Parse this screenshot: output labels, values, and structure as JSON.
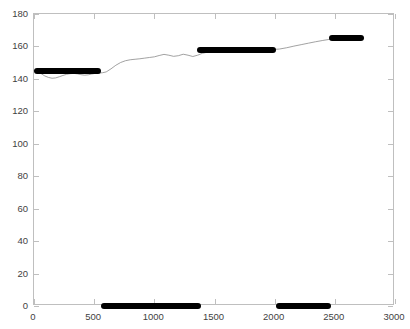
{
  "chart_data": {
    "type": "line",
    "title": "",
    "xlabel": "",
    "ylabel": "",
    "xlim": [
      0,
      3000
    ],
    "ylim": [
      0,
      180
    ],
    "xticks": [
      0,
      500,
      1000,
      1500,
      2000,
      2500,
      3000
    ],
    "yticks": [
      0,
      20,
      40,
      60,
      80,
      100,
      120,
      140,
      160,
      180
    ],
    "xtick_labels": [
      "0",
      "500",
      "1000",
      "1500",
      "2000",
      "2500",
      "3000"
    ],
    "ytick_labels": [
      "0",
      "20",
      "40",
      "60",
      "80",
      "100",
      "120",
      "140",
      "160",
      "180"
    ],
    "grid": false,
    "legend": null,
    "series": [
      {
        "name": "signal-trace",
        "style": "thin-line",
        "color": "#8a8a8a",
        "linewidth": 0.8,
        "x": [
          0,
          30,
          60,
          90,
          120,
          150,
          180,
          210,
          240,
          270,
          300,
          330,
          360,
          390,
          420,
          450,
          480,
          510,
          540,
          570,
          600,
          640,
          680,
          720,
          760,
          800,
          840,
          880,
          920,
          960,
          1000,
          1040,
          1080,
          1120,
          1160,
          1200,
          1240,
          1280,
          1320,
          1360,
          1400,
          1450,
          1500,
          1560,
          1620,
          1680,
          1740,
          1800,
          1860,
          1920,
          1980,
          2040,
          2100,
          2160,
          2220,
          2280,
          2340,
          2400,
          2450,
          2500,
          2560,
          2620,
          2680,
          2740
        ],
        "y": [
          145,
          144.5,
          143.2,
          141.8,
          140.9,
          140.4,
          140.6,
          141.3,
          142.1,
          142.8,
          143.2,
          143.4,
          143.1,
          142.6,
          142.3,
          142.5,
          143.0,
          143.4,
          143.6,
          143.8,
          144.3,
          146.2,
          148.4,
          150.1,
          151.2,
          151.8,
          152.1,
          152.4,
          152.8,
          153.2,
          153.6,
          154.4,
          155.1,
          154.6,
          153.9,
          154.3,
          155.2,
          154.6,
          153.8,
          154.6,
          155.8,
          156.6,
          157.2,
          157.6,
          157.8,
          157.9,
          157.9,
          158.0,
          158.0,
          158.0,
          158.1,
          158.4,
          159.2,
          160.2,
          161.1,
          162.0,
          162.9,
          163.7,
          164.3,
          164.8,
          165.1,
          165.2,
          165.2,
          165.2
        ]
      }
    ],
    "bars_upper": [
      {
        "name": "plateau-segment-1",
        "x_start": 0,
        "x_end": 560,
        "y": 145.0,
        "color": "#000000"
      },
      {
        "name": "plateau-segment-2",
        "x_start": 1355,
        "x_end": 2010,
        "y": 158.0,
        "color": "#000000"
      },
      {
        "name": "plateau-segment-3",
        "x_start": 2450,
        "x_end": 2745,
        "y": 165.2,
        "color": "#000000"
      }
    ],
    "bars_baseline": [
      {
        "name": "baseline-segment-1",
        "x_start": 560,
        "x_end": 1390,
        "y": 0,
        "color": "#000000"
      },
      {
        "name": "baseline-segment-2",
        "x_start": 2010,
        "x_end": 2470,
        "y": 0,
        "color": "#000000"
      }
    ]
  },
  "axes": {
    "frame_color": "#bfbfbf",
    "tick_color": "#bfbfbf",
    "label_color": "#3f3f3f",
    "background": "#ffffff"
  }
}
